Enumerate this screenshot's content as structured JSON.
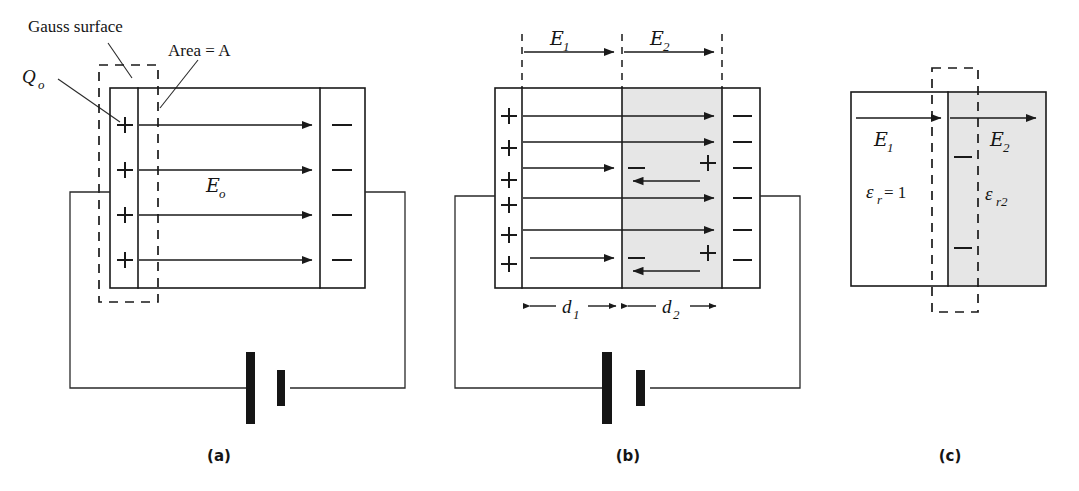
{
  "figure": {
    "background_color": "#ffffff",
    "ink_color": "#1a1a1a",
    "dielectric_shade_color": "#e6e6e6"
  },
  "panels": [
    {
      "id": "a",
      "caption": "(a)",
      "annotations": {
        "gauss_surface_label": "Gauss surface",
        "area_label": "Area = A",
        "charge_label_base": "Q",
        "charge_label_sub": "o",
        "field_label_base": "E",
        "field_label_sub": "o"
      },
      "left_plate_charges": [
        "+",
        "+",
        "+",
        "+"
      ],
      "right_plate_charges": [
        "−",
        "−",
        "−",
        "−"
      ],
      "field_line_count": 4,
      "has_dielectric": false,
      "has_battery": true
    },
    {
      "id": "b",
      "caption": "(b)",
      "annotations": {
        "field1_base": "E",
        "field1_sub": "1",
        "field2_base": "E",
        "field2_sub": "2",
        "dim1_base": "d",
        "dim1_sub": "1",
        "dim2_base": "d",
        "dim2_sub": "2"
      },
      "left_plate_charges": [
        "+",
        "+",
        "+",
        "+",
        "+",
        "+"
      ],
      "right_plate_charges": [
        "−",
        "−",
        "−",
        "−",
        "−",
        "−"
      ],
      "dielectric_bound_left_charges": [
        "−",
        "−"
      ],
      "dielectric_bound_right_charges": [
        "+",
        "+"
      ],
      "field_line_count": 6,
      "reverse_field_line_count": 2,
      "has_dielectric": true,
      "has_battery": true
    },
    {
      "id": "c",
      "caption": "(c)",
      "annotations": {
        "field1_base": "E",
        "field1_sub": "1",
        "field2_base": "E",
        "field2_sub": "2",
        "permittivity1_base": "ε",
        "permittivity1_sub": "r",
        "permittivity1_value": " = 1",
        "permittivity2_base": "ε",
        "permittivity2_sub": "r2"
      },
      "bound_charges": [
        "−",
        "−"
      ],
      "has_dielectric": true,
      "has_battery": false,
      "has_gauss_box": true
    }
  ]
}
